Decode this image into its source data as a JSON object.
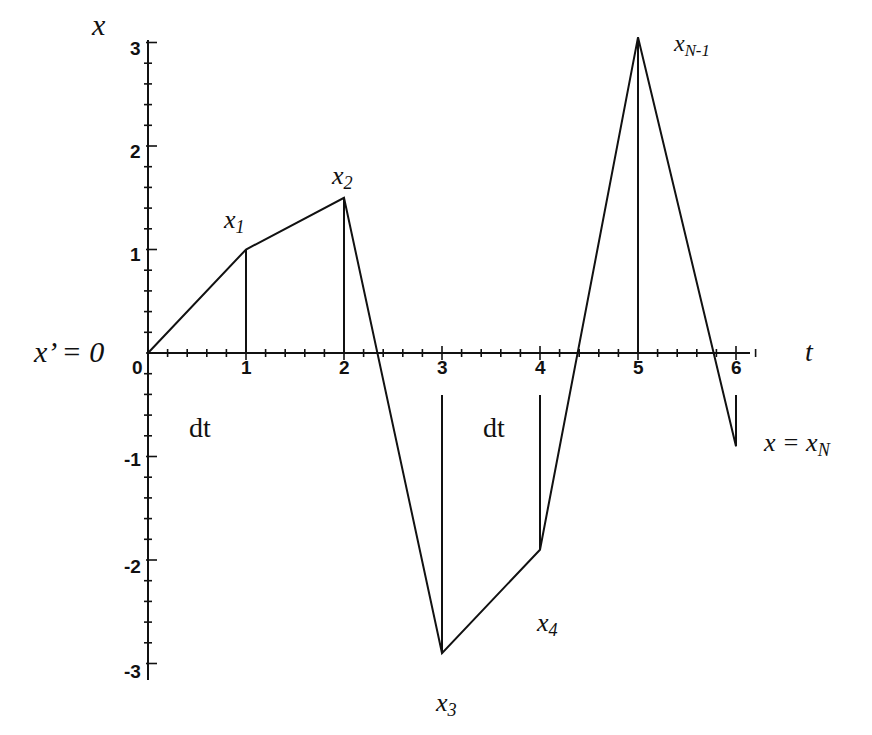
{
  "chart_data": {
    "type": "line",
    "title": "",
    "xlabel": "t",
    "ylabel": "x",
    "x": [
      0,
      1,
      2,
      3,
      4,
      5,
      6
    ],
    "series": [
      {
        "name": "x(t) path",
        "values": [
          0,
          1.0,
          1.5,
          -2.9,
          -1.9,
          3.05,
          -0.9
        ]
      }
    ],
    "xlim": [
      0,
      6.2
    ],
    "ylim": [
      -3,
      3
    ],
    "x_ticks": [
      "0",
      "1",
      "2",
      "3",
      "4",
      "5",
      "6"
    ],
    "y_ticks": [
      "3",
      "2",
      "1",
      "-1",
      "-2",
      "-3"
    ],
    "grid": false,
    "point_labels": [
      "x1",
      "x2",
      "x3",
      "x4",
      "xN-1"
    ],
    "annotations": [
      "x' = 0",
      "dt",
      "dt",
      "x = xN"
    ]
  },
  "labels": {
    "y_axis": "x",
    "x_axis": "t",
    "origin_condition": "x’ = 0",
    "dt_left": "dt",
    "dt_right": "dt",
    "end_condition": "x = x",
    "end_sub": "N",
    "x1": "x",
    "x1_sub": "1",
    "x2": "x",
    "x2_sub": "2",
    "x3": "x",
    "x3_sub": "3",
    "x4": "x",
    "x4_sub": "4",
    "xn1": "x",
    "xn1_sub": "N-1"
  },
  "ticks": {
    "x": [
      "0",
      "1",
      "2",
      "3",
      "4",
      "5",
      "6"
    ],
    "y": [
      "3",
      "2",
      "1",
      "-1",
      "-2",
      "-3"
    ]
  },
  "colors": {
    "ink": "#111111",
    "background": "#ffffff"
  }
}
